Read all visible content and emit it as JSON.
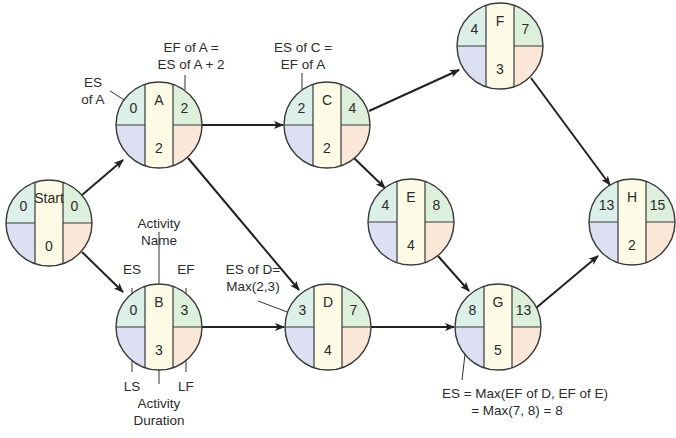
{
  "colors": {
    "es": "#dcefe9",
    "ls": "#dde0f3",
    "center": "#fdfbe6",
    "ef": "#ddf0dc",
    "lf": "#fbe7d8",
    "stroke": "#3a3a3a",
    "text": "#2b2b2b"
  },
  "nodes": [
    {
      "id": "start",
      "name": "Start",
      "es": "0",
      "ef": "0",
      "duration": "0",
      "cx": 49,
      "cy": 223
    },
    {
      "id": "A",
      "name": "A",
      "es": "0",
      "ef": "2",
      "duration": "2",
      "cx": 159,
      "cy": 125
    },
    {
      "id": "B",
      "name": "B",
      "es": "0",
      "ef": "3",
      "duration": "3",
      "cx": 159,
      "cy": 327
    },
    {
      "id": "C",
      "name": "C",
      "es": "2",
      "ef": "4",
      "duration": "2",
      "cx": 327,
      "cy": 125
    },
    {
      "id": "D",
      "name": "D",
      "es": "3",
      "ef": "7",
      "duration": "4",
      "cx": 328,
      "cy": 327
    },
    {
      "id": "E",
      "name": "E",
      "es": "4",
      "ef": "8",
      "duration": "4",
      "cx": 411,
      "cy": 222
    },
    {
      "id": "F",
      "name": "F",
      "es": "4",
      "ef": "7",
      "duration": "3",
      "cx": 500,
      "cy": 46
    },
    {
      "id": "G",
      "name": "G",
      "es": "8",
      "ef": "13",
      "duration": "5",
      "cx": 498,
      "cy": 327
    },
    {
      "id": "H",
      "name": "H",
      "es": "13",
      "ef": "15",
      "duration": "2",
      "cx": 632,
      "cy": 222
    }
  ],
  "edges": [
    {
      "from": "start",
      "to": "A"
    },
    {
      "from": "start",
      "to": "B"
    },
    {
      "from": "A",
      "to": "C"
    },
    {
      "from": "A",
      "to": "D"
    },
    {
      "from": "B",
      "to": "D"
    },
    {
      "from": "C",
      "to": "F"
    },
    {
      "from": "C",
      "to": "E"
    },
    {
      "from": "D",
      "to": "G"
    },
    {
      "from": "E",
      "to": "G"
    },
    {
      "from": "F",
      "to": "H"
    },
    {
      "from": "G",
      "to": "H"
    }
  ],
  "annotations": {
    "es_of_a": [
      "ES",
      "of A"
    ],
    "ef_of_a": [
      "EF of A =",
      "ES of A + 2"
    ],
    "es_of_c": [
      "ES of C =",
      "EF of A"
    ],
    "activity_name": [
      "Activity",
      "Name"
    ],
    "es_label": "ES",
    "ef_label": "EF",
    "ls_label": "LS",
    "lf_label": "LF",
    "activity_duration": [
      "Activity",
      "Duration"
    ],
    "es_of_d": [
      "ES of D=",
      "Max(2,3)"
    ],
    "es_of_g": [
      "ES = Max(EF of D, EF of E)",
      "= Max(7, 8) = 8"
    ]
  }
}
